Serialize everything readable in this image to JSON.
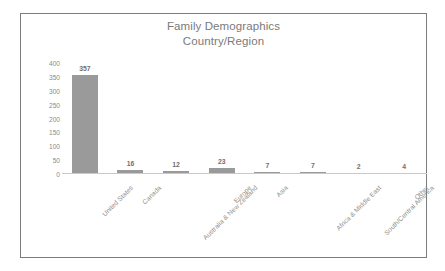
{
  "chart_data": {
    "type": "bar",
    "title": "Family Demographics",
    "subtitle": "Country/Region",
    "xlabel": "",
    "ylabel": "",
    "ylim": [
      0,
      400
    ],
    "ytick_step": 50,
    "grid": false,
    "legend": "none",
    "bar_color": "#9a9a9a",
    "categories": [
      "United States",
      "Canada",
      "Australia & New Zealand",
      "Europe",
      "Asia",
      "Africa & Middle East",
      "South/Central America",
      "Other"
    ],
    "values": [
      357,
      16,
      12,
      23,
      7,
      7,
      2,
      4
    ],
    "data_labels": [
      "357",
      "16",
      "12",
      "23",
      "7",
      "7",
      "2",
      "4"
    ],
    "ytick_labels": [
      "400",
      "350",
      "300",
      "250",
      "200",
      "150",
      "100",
      "50",
      "0"
    ],
    "ytick_values": [
      400,
      350,
      300,
      250,
      200,
      150,
      100,
      50,
      0
    ]
  },
  "colors": {
    "frame_border": "#7c7c7c",
    "title_text": "#7a7a7a",
    "tick_text": "#8a8a8a",
    "axis_line": "#c9c9c9",
    "value_text": "#6f6f6f",
    "background": "#ffffff"
  }
}
